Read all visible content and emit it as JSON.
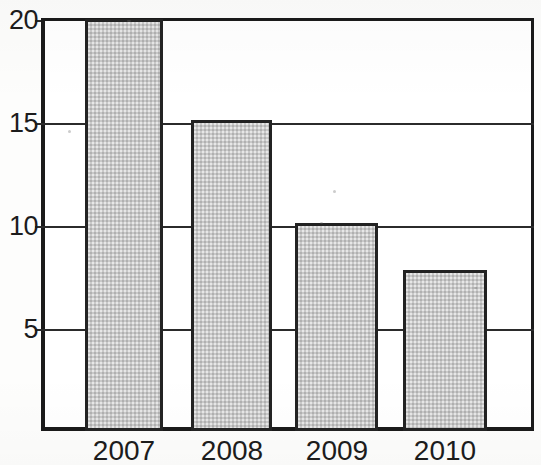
{
  "chart_data": {
    "type": "bar",
    "title": "",
    "subtitle": "",
    "xlabel": "",
    "ylabel": "",
    "categories": [
      "2007",
      "2008",
      "2009",
      "2010"
    ],
    "values": [
      20,
      15.1,
      10.1,
      7.8
    ],
    "series": [
      {
        "name": "",
        "values": [
          20,
          15.1,
          10.1,
          7.8
        ]
      }
    ],
    "ylim": [
      0,
      20
    ],
    "y_ticks": [
      5,
      10,
      15,
      20
    ],
    "y_tick_labels": [
      "5",
      "10",
      "15",
      "20"
    ],
    "grid": true,
    "grid_axis": "y",
    "legend": false,
    "legend_position": "none",
    "bar_fill_color": "#c9c9c9",
    "bar_edge_color": "#232323",
    "axis_color": "#1a1a1a",
    "background_color": "#ffffff",
    "annotations": []
  },
  "axes": {
    "y_tick_labels": [
      "20",
      "15",
      "10",
      "5"
    ],
    "x_tick_labels": [
      "2007",
      "2008",
      "2009",
      "2010"
    ]
  }
}
